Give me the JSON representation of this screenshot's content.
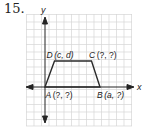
{
  "problem": {
    "number": "15."
  },
  "axes": {
    "x_label": "x",
    "y_label": "y"
  },
  "grid": {
    "color": "#d9d9d9",
    "cell_px": 7.4
  },
  "figure": {
    "shape": "trapezoid",
    "stroke": "#2b2b2b",
    "points": {
      "A": {
        "label": "A (?, ?)",
        "name": "A",
        "coords": "(?, ?)"
      },
      "B": {
        "label": "B (a, ?)",
        "name": "B",
        "coords": "(a, ?)"
      },
      "C": {
        "label": "C (?, ?)",
        "name": "C",
        "coords": "(?, ?)"
      },
      "D": {
        "label": "D (c, d)",
        "name": "D",
        "coords": "(c, d)"
      }
    }
  }
}
